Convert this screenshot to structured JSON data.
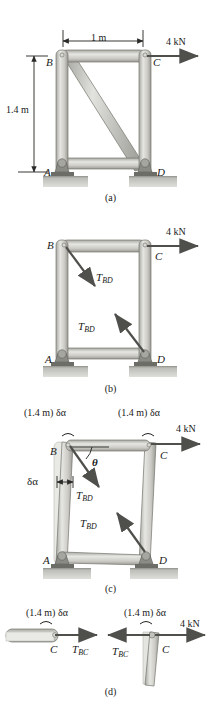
{
  "figure": {
    "colors": {
      "member_fill": "#c9c9c4",
      "member_light": "#e3e3df",
      "member_dark": "#9d9d98",
      "outline": "#6e6e6a",
      "ground": "#b5b5b0",
      "arrow": "#555552",
      "text": "#1a1a1a"
    }
  },
  "panels": [
    {
      "tag": "(a)",
      "caption": "Frame with diagonal member BD, pinned at A and D",
      "dimensions": {
        "width_label": "1 m",
        "height_label": "1.4 m"
      },
      "load": {
        "label": "4 kN",
        "direction": "right"
      },
      "joints": [
        "B",
        "C",
        "A",
        "D"
      ]
    },
    {
      "tag": "(b)",
      "caption": "Free-body diagram with member BD removed, replaced by tension forces",
      "load": {
        "label": "4 kN",
        "direction": "right"
      },
      "joints": [
        "B",
        "C",
        "A",
        "D"
      ],
      "forces": [
        {
          "symbol": "T",
          "subscript": "BD",
          "at": "B"
        },
        {
          "symbol": "T",
          "subscript": "BD",
          "at": "D"
        }
      ]
    },
    {
      "tag": "(c)",
      "caption": "Virtual displacement of the frame through angle delta-alpha",
      "load": {
        "label": "4 kN",
        "direction": "right"
      },
      "joints": [
        "B",
        "C",
        "A",
        "D"
      ],
      "virtual_displacements": [
        {
          "label": "(1.4 m) δα",
          "at": "B"
        },
        {
          "label": "(1.4 m) δα",
          "at": "C"
        }
      ],
      "angle_labels": [
        {
          "label": "δα",
          "at": "column-AB"
        },
        {
          "label": "θ",
          "at": "B"
        }
      ],
      "forces": [
        {
          "symbol": "T",
          "subscript": "BD",
          "at": "B"
        },
        {
          "symbol": "T",
          "subscript": "BD",
          "at": "D"
        }
      ]
    },
    {
      "tag": "(d)",
      "caption": "Virtual displacements of joint C for member BC and column CD",
      "left": {
        "displacement_label": "(1.4 m) δα",
        "joint": "C",
        "force": {
          "symbol": "T",
          "subscript": "BC",
          "direction": "right"
        }
      },
      "right": {
        "displacement_label": "(1.4 m) δα",
        "joint": "C",
        "force": {
          "symbol": "T",
          "subscript": "BC",
          "direction": "left"
        },
        "load": {
          "label": "4 kN",
          "direction": "right"
        }
      }
    }
  ]
}
